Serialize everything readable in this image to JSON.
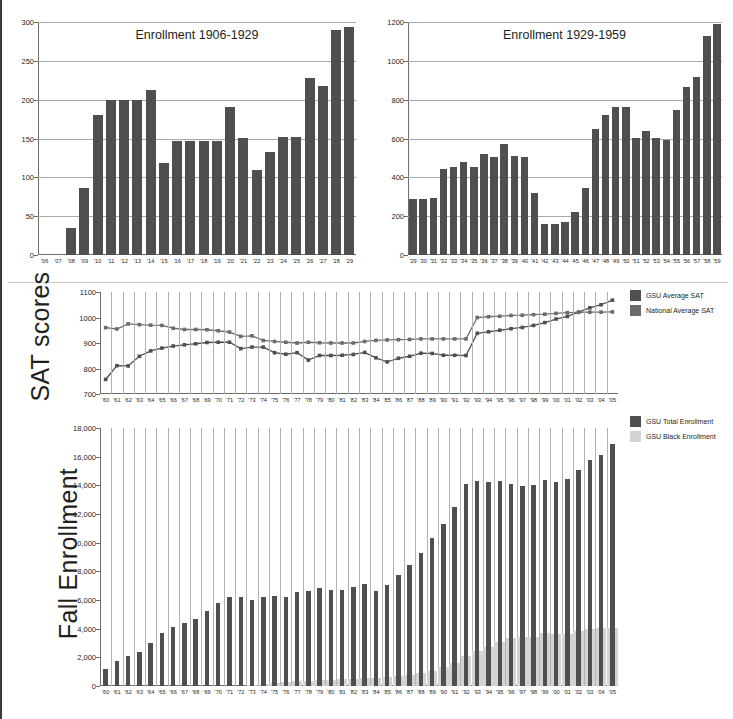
{
  "page": {
    "title": "",
    "background": "#ffffff",
    "accent_dark": "#4f4f4f",
    "accent_light": "#d3d3d3",
    "grid_color": "#a8a8a8"
  },
  "panels": {
    "enrollment_1906_1929": {
      "title": "Enrollment 1906-1929",
      "ylabel": "",
      "yticks": [
        "0",
        "50",
        "100",
        "150",
        "200",
        "250",
        "300"
      ]
    },
    "enrollment_1929_1959": {
      "title": "Enrollment 1929-1959",
      "ylabel": "",
      "yticks": [
        "0",
        "200",
        "400",
        "600",
        "800",
        "1000",
        "1200"
      ]
    },
    "sat": {
      "ylabel": "SAT scores",
      "yticks": [
        "700",
        "800",
        "900",
        "1000",
        "1100"
      ],
      "legend": [
        {
          "label": "GSU Average SAT",
          "color": "#4f4f4f"
        },
        {
          "label": "National Average SAT",
          "color": "#6b6b6b"
        }
      ]
    },
    "fall_enrollment": {
      "ylabel": "Fall Enrollment",
      "yticks": [
        "0",
        "2,000",
        "4,000",
        "6,000",
        "8,000",
        "10,000",
        "12,000",
        "14,000",
        "16,000",
        "18,000"
      ],
      "legend": [
        {
          "label": "GSU Total Enrollment",
          "color": "#4f4f4f"
        },
        {
          "label": "GSU Black Enrollment",
          "color": "#d3d3d3"
        }
      ]
    }
  },
  "chart_data": [
    {
      "id": "enrollment_1906_1929",
      "type": "bar",
      "title": "Enrollment 1906-1929",
      "xlabel": "",
      "ylabel": "",
      "ylim": [
        0,
        300
      ],
      "ytick_values": [
        0,
        50,
        100,
        150,
        200,
        250,
        300
      ],
      "grid": true,
      "legend": "none",
      "categories": [
        "'06",
        "'07",
        "'08",
        "'09",
        "'10",
        "'11",
        "'12",
        "'13",
        "'14",
        "'15",
        "'16",
        "'17",
        "'18",
        "'19",
        "'20",
        "'21",
        "'22",
        "'23",
        "'24",
        "'25",
        "'26",
        "'27",
        "'28",
        "'29"
      ],
      "values": [
        0,
        0,
        35,
        86,
        180,
        200,
        200,
        200,
        213,
        118,
        147,
        147,
        147,
        147,
        190,
        151,
        110,
        132,
        152,
        152,
        228,
        217,
        290,
        294
      ]
    },
    {
      "id": "enrollment_1929_1959",
      "type": "bar",
      "title": "Enrollment 1929-1959",
      "xlabel": "",
      "ylabel": "",
      "ylim": [
        0,
        1200
      ],
      "ytick_values": [
        0,
        200,
        400,
        600,
        800,
        1000,
        1200
      ],
      "grid": true,
      "legend": "none",
      "categories": [
        "'29",
        "'30",
        "'31",
        "'32",
        "'33",
        "'34",
        "'35",
        "'36",
        "'37",
        "'38",
        "'39",
        "'40",
        "'41",
        "'42",
        "'43",
        "'44",
        "'45",
        "'46",
        "'47",
        "'48",
        "'49",
        "'50",
        "'51",
        "'52",
        "'53",
        "'54",
        "'55",
        "'56",
        "'57",
        "'58",
        "'59"
      ],
      "values": [
        288,
        290,
        293,
        443,
        455,
        477,
        453,
        520,
        507,
        573,
        510,
        506,
        320,
        162,
        159,
        168,
        222,
        343,
        648,
        722,
        763,
        762,
        603,
        639,
        602,
        592,
        747,
        866,
        917,
        1128,
        1188
      ]
    },
    {
      "id": "sat",
      "type": "line",
      "title": "",
      "xlabel": "",
      "ylabel": "SAT scores",
      "ylim": [
        700,
        1100
      ],
      "ytick_values": [
        700,
        800,
        900,
        1000,
        1100
      ],
      "grid": true,
      "legend": "right",
      "x": [
        "'60",
        "'61",
        "'62",
        "'63",
        "'64",
        "'65",
        "'66",
        "'67",
        "'68",
        "'69",
        "'70",
        "'71",
        "'72",
        "'73",
        "'74",
        "'75",
        "'76",
        "'77",
        "'78",
        "'79",
        "'80",
        "'81",
        "'82",
        "'83",
        "'84",
        "'85",
        "'86",
        "'87",
        "'88",
        "'89",
        "'90",
        "'91",
        "'92",
        "'93",
        "'94",
        "'95",
        "'96",
        "'97",
        "'98",
        "'99",
        "'00",
        "'01",
        "'02",
        "'03",
        "'04",
        "'05"
      ],
      "series": [
        {
          "name": "GSU Average SAT",
          "color": "#4f4f4f",
          "values": [
            757,
            811,
            810,
            848,
            869,
            880,
            888,
            893,
            897,
            902,
            903,
            903,
            878,
            884,
            884,
            862,
            856,
            862,
            833,
            851,
            851,
            852,
            855,
            863,
            842,
            826,
            840,
            848,
            860,
            859,
            852,
            852,
            851,
            938,
            944,
            950,
            956,
            961,
            969,
            980,
            994,
            1004,
            1021,
            1038,
            1050,
            1068
          ]
        },
        {
          "name": "National Average SAT",
          "color": "#6b6b6b",
          "values": [
            960,
            955,
            975,
            972,
            970,
            969,
            958,
            953,
            953,
            952,
            948,
            943,
            926,
            928,
            910,
            906,
            903,
            900,
            903,
            901,
            900,
            900,
            900,
            906,
            910,
            912,
            913,
            914,
            916,
            916,
            916,
            916,
            916,
            1000,
            1003,
            1005,
            1008,
            1009,
            1011,
            1013,
            1016,
            1019,
            1020,
            1021,
            1021,
            1022
          ]
        }
      ]
    },
    {
      "id": "fall_enrollment",
      "type": "bar",
      "title": "",
      "xlabel": "",
      "ylabel": "Fall Enrollment",
      "ylim": [
        0,
        18000
      ],
      "ytick_values": [
        0,
        2000,
        4000,
        6000,
        8000,
        10000,
        12000,
        14000,
        16000,
        18000
      ],
      "grid": false,
      "legend": "top-right",
      "categories": [
        "'60",
        "'61",
        "'62",
        "'63",
        "'64",
        "'65",
        "'66",
        "'67",
        "'68",
        "'69",
        "'70",
        "'71",
        "'72",
        "'73",
        "'74",
        "'75",
        "'76",
        "'77",
        "'78",
        "'79",
        "'80",
        "'81",
        "'82",
        "'83",
        "'84",
        "'85",
        "'86",
        "'87",
        "'88",
        "'89",
        "'90",
        "'91",
        "'92",
        "'93",
        "'94",
        "'95",
        "'96",
        "'97",
        "'98",
        "'99",
        "'00",
        "'01",
        "'02",
        "'03",
        "'04",
        "'05"
      ],
      "series": [
        {
          "name": "GSU Total Enrollment",
          "color": "#4f4f4f",
          "values": [
            1200,
            1750,
            2120,
            2380,
            2970,
            3680,
            4090,
            4430,
            4680,
            5230,
            5770,
            6200,
            6220,
            6000,
            6200,
            6310,
            6200,
            6550,
            6600,
            6820,
            6720,
            6700,
            6930,
            7120,
            6660,
            7060,
            7740,
            8470,
            9310,
            10330,
            11330,
            12480,
            14120,
            14300,
            14200,
            14320,
            14070,
            13950,
            14010,
            14400,
            14230,
            14420,
            15100,
            15800,
            16100,
            16900
          ]
        },
        {
          "name": "GSU Black Enrollment",
          "color": "#d3d3d3",
          "values": [
            0,
            0,
            0,
            0,
            0,
            0,
            0,
            0,
            0,
            0,
            0,
            0,
            0,
            60,
            120,
            200,
            260,
            330,
            380,
            420,
            450,
            470,
            520,
            560,
            580,
            620,
            700,
            800,
            920,
            1060,
            1320,
            1600,
            2080,
            2450,
            2700,
            3080,
            3340,
            3400,
            3420,
            3700,
            3650,
            3640,
            3810,
            3960,
            4020,
            4060
          ]
        }
      ]
    }
  ]
}
